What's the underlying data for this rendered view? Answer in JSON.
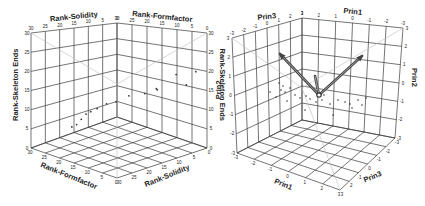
{
  "chart_data": [
    {
      "type": "scatter",
      "subtype": "3d-scatter",
      "title": "",
      "axes": {
        "x": {
          "label": "Rank-Formfactor",
          "ticks": [
            "30",
            "25",
            "20",
            "15",
            "10",
            "5",
            "0"
          ]
        },
        "y": {
          "label": "Rank-Solidity",
          "ticks": [
            "30",
            "25",
            "20",
            "15",
            "10",
            "5",
            "0"
          ]
        },
        "z": {
          "label": "Rank-Skeleton Ends",
          "ticks": [
            "0",
            "5",
            "10",
            "15",
            "20",
            "25",
            "30"
          ]
        }
      },
      "bottom_formfactor_ticks": [
        "30",
        "21",
        "20",
        "15",
        "10",
        "5",
        "0"
      ],
      "bottom_solidity_ticks": [
        "30",
        "25",
        "20",
        "15",
        "10",
        "5",
        "0"
      ],
      "grid": true,
      "points_approx": [
        {
          "formfactor": 28,
          "solidity": 3,
          "skeleton_ends": 27
        },
        {
          "formfactor": 26,
          "solidity": 5,
          "skeleton_ends": 22
        },
        {
          "formfactor": 22,
          "solidity": 4,
          "skeleton_ends": 24
        },
        {
          "formfactor": 20,
          "solidity": 12,
          "skeleton_ends": 20
        },
        {
          "formfactor": 18,
          "solidity": 8,
          "skeleton_ends": 18
        },
        {
          "formfactor": 15,
          "solidity": 10,
          "skeleton_ends": 16
        },
        {
          "formfactor": 12,
          "solidity": 14,
          "skeleton_ends": 15
        },
        {
          "formfactor": 10,
          "solidity": 18,
          "skeleton_ends": 13
        },
        {
          "formfactor": 8,
          "solidity": 20,
          "skeleton_ends": 12
        },
        {
          "formfactor": 6,
          "solidity": 22,
          "skeleton_ends": 10
        },
        {
          "formfactor": 5,
          "solidity": 24,
          "skeleton_ends": 9
        },
        {
          "formfactor": 4,
          "solidity": 25,
          "skeleton_ends": 8
        },
        {
          "formfactor": 3,
          "solidity": 26,
          "skeleton_ends": 6
        },
        {
          "formfactor": 2,
          "solidity": 27,
          "skeleton_ends": 4
        },
        {
          "formfactor": 1,
          "solidity": 28,
          "skeleton_ends": 3
        }
      ]
    },
    {
      "type": "scatter",
      "subtype": "3d-biplot",
      "title": "",
      "axes": {
        "x": {
          "label": "Prin1",
          "ticks": [
            "3",
            "2",
            "1",
            "0",
            "-1",
            "-2",
            "-3"
          ]
        },
        "y": {
          "label": "Prin3",
          "ticks": [
            "-3",
            "-2",
            "-1",
            "0",
            "1",
            "2",
            "3"
          ]
        },
        "z": {
          "label": "Prin2",
          "ticks": [
            "-3",
            "-2",
            "-1",
            "0",
            "1",
            "2",
            "3"
          ]
        }
      },
      "vectors": [
        {
          "name": "vector-1",
          "direction": "up-left"
        },
        {
          "name": "vector-2",
          "direction": "up-right"
        },
        {
          "name": "vector-3",
          "direction": "short-up"
        }
      ],
      "grid": true
    }
  ],
  "left_plot": {
    "top_left_label": "Rank-Solidity",
    "top_right_label": "Rank-Formfactor",
    "left_side_label": "Rank-Skeleton Ends",
    "right_side_label": "Rank-Skeleton Ends",
    "bottom_left_label": "Rank-Formfactor",
    "bottom_right_label": "Rank-Solidity",
    "top_left_ticks": [
      "30",
      "25",
      "20",
      "15",
      "10",
      "5",
      "0"
    ],
    "top_right_ticks": [
      "30",
      "25",
      "20",
      "15",
      "10",
      "5",
      "0"
    ],
    "left_ticks": [
      "30",
      "25",
      "20",
      "15",
      "10",
      "5",
      "0"
    ],
    "right_ticks": [
      "30",
      "25",
      "20",
      "15",
      "10",
      "5",
      "0"
    ],
    "bottom_left_ticks": [
      "30",
      "25",
      "20",
      "15",
      "10",
      "5",
      "0"
    ],
    "bottom_right_ticks": [
      "30",
      "25",
      "20",
      "15",
      "10",
      "5",
      "0"
    ]
  },
  "right_plot": {
    "top_left_label": "Prin3",
    "top_right_label": "Prin1",
    "left_side_label": "Prin2",
    "right_side_label": "Prin2",
    "bottom_left_label": "Prin1",
    "bottom_right_label": "Prin3",
    "top_left_ticks": [
      "-3",
      "-2",
      "-1",
      "0",
      "1",
      "2",
      "3"
    ],
    "top_right_ticks": [
      "3",
      "2",
      "1",
      "0",
      "-1",
      "-2",
      "-3"
    ],
    "left_ticks": [
      "3",
      "2",
      "1",
      "0",
      "-1",
      "-2",
      "-3"
    ],
    "right_ticks": [
      "3",
      "2",
      "1",
      "0",
      "-1",
      "-2",
      "-3"
    ],
    "bottom_left_ticks": [
      "-3",
      "-2",
      "-1",
      "0",
      "1",
      "2",
      "3"
    ],
    "bottom_right_ticks": [
      "3",
      "2",
      "1",
      "0",
      "-1",
      "-2",
      "-3"
    ]
  }
}
